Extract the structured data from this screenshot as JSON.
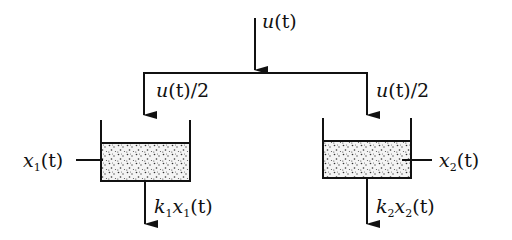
{
  "diagram": {
    "type": "two-tank flow system",
    "input": {
      "label": "u(t)",
      "var": "u",
      "arg": "(t)"
    },
    "branches": [
      {
        "label": "u(t)/2",
        "var": "u",
        "arg": "(t)/2"
      },
      {
        "label": "u(t)/2",
        "var": "u",
        "arg": "(t)/2"
      }
    ],
    "tanks": [
      {
        "name": "tank-1",
        "level_label": "x₁(t)",
        "level_var": "x",
        "level_sub": "1",
        "level_arg": "(t)",
        "outflow_label": "k₁x₁(t)",
        "k": "k",
        "k_sub": "1",
        "x": "x",
        "x_sub": "1",
        "arg": "(t)"
      },
      {
        "name": "tank-2",
        "level_label": "x₂(t)",
        "level_var": "x",
        "level_sub": "2",
        "level_arg": "(t)",
        "outflow_label": "k₂x₂(t)",
        "k": "k",
        "k_sub": "2",
        "x": "x",
        "x_sub": "2",
        "arg": "(t)"
      }
    ],
    "colors": {
      "ink": "#111111",
      "fluid_bg": "#f2f2f2",
      "background": "#ffffff"
    }
  }
}
